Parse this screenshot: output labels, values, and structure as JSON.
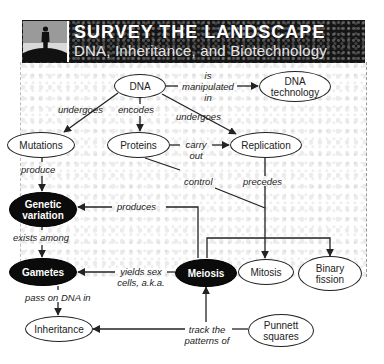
{
  "banner": {
    "title": "SURVEY THE LANDSCAPE",
    "subtitle": "DNA, Inheritance, and Biotechnology",
    "icon": "person-on-hill-icon"
  },
  "nodes": {
    "dna": "DNA",
    "dna_technology": "DNA technology",
    "mutations": "Mutations",
    "proteins": "Proteins",
    "replication": "Replication",
    "genetic_variation": "Genetic variation",
    "gametes": "Gametes",
    "meiosis": "Meiosis",
    "mitosis": "Mitosis",
    "binary_fission": "Binary fission",
    "inheritance": "Inheritance",
    "punnett_squares": "Punnett squares"
  },
  "links": {
    "is_manipulated_in": "is manipulated in",
    "undergoes_left": "undergoes",
    "encodes": "encodes",
    "undergoes_right": "undergoes",
    "carry_out": "carry out",
    "produce": "produce",
    "control": "control",
    "precedes": "precedes",
    "produces": "produces",
    "exists_among": "exists among",
    "yields_sex_cells": "yields sex cells, a.k.a.",
    "pass_on_dna_in": "pass on DNA in",
    "track_the_patterns_of": "track the patterns of"
  },
  "colors": {
    "dark_node": "#0b0b0b",
    "line": "#222222",
    "banner": "#151515"
  }
}
